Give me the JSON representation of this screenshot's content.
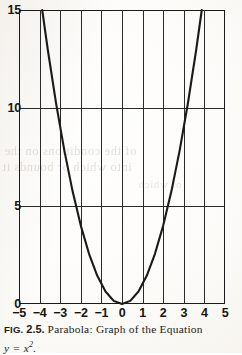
{
  "figure": {
    "caption_prefix": "FIG.",
    "caption_number": "2.5.",
    "caption_text": "Parabola: Graph of the Equation",
    "caption_equation_lhs": "y",
    "caption_equation_eq": "=",
    "caption_equation_base": "x",
    "caption_equation_exponent": "2",
    "caption_equation_period": "."
  },
  "bleed_text": {
    "line1": "of the conditions on the",
    "line2": "into which or bounds it",
    "line3": "of which"
  },
  "chart_data": {
    "type": "line",
    "equation": "y = x^2",
    "xlabel": "",
    "ylabel": "",
    "xlim": [
      -5,
      5
    ],
    "ylim": [
      0,
      15
    ],
    "grid": true,
    "legend": false,
    "x_ticks": [
      "-5",
      "-4",
      "-3",
      "-2",
      "-1",
      "0",
      "1",
      "2",
      "3",
      "4",
      "5"
    ],
    "x_tick_values": [
      -5,
      -4,
      -3,
      -2,
      -1,
      0,
      1,
      2,
      3,
      4,
      5
    ],
    "y_ticks": [
      "0",
      "5",
      "10",
      "15"
    ],
    "y_tick_values": [
      0,
      5,
      10,
      15
    ],
    "x_gridlines": [
      -5,
      -4,
      -3,
      -2,
      -1,
      0,
      1,
      2,
      3,
      4,
      5
    ],
    "y_gridlines": [
      5,
      10
    ],
    "series": [
      {
        "name": "y = x^2",
        "color": "#1a1a1a",
        "x": [
          -3.873,
          -3.6,
          -3.2,
          -2.8,
          -2.4,
          -2.0,
          -1.6,
          -1.2,
          -0.8,
          -0.4,
          0.0,
          0.4,
          0.8,
          1.2,
          1.6,
          2.0,
          2.4,
          2.8,
          3.2,
          3.6,
          3.873
        ],
        "values": [
          15.0,
          12.96,
          10.24,
          7.84,
          5.76,
          4.0,
          2.56,
          1.44,
          0.64,
          0.16,
          0.0,
          0.16,
          0.64,
          1.44,
          2.56,
          4.0,
          5.76,
          7.84,
          10.24,
          12.96,
          15.0
        ]
      }
    ],
    "annotations": [
      {
        "label": "vertex",
        "x": 0,
        "y": 0
      }
    ]
  }
}
